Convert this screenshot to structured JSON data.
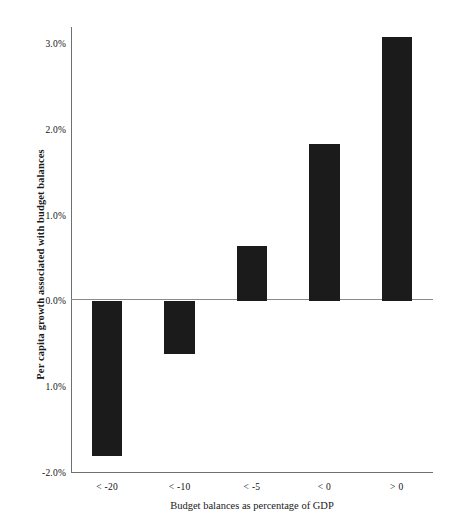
{
  "chart_data": {
    "type": "bar",
    "title": "",
    "subtitle": "",
    "xlabel": "Budget balances as percentage of GDP",
    "ylabel": "Per capita growth associated with budget balances",
    "categories": [
      "< -20",
      "< -10",
      "< -5",
      "< 0",
      "> 0"
    ],
    "values": [
      -1.8,
      -0.61,
      0.65,
      1.84,
      3.08
    ],
    "series": [
      {
        "name": "Per capita growth",
        "values": [
          -1.8,
          -0.61,
          0.65,
          1.84,
          3.08
        ]
      }
    ],
    "ylim": [
      -2.0,
      3.2
    ],
    "ytick_values": [
      3.0,
      2.0,
      1.0,
      0.0,
      -1.0,
      -2.0
    ],
    "ytick_labels": [
      "3.0%",
      "2.0%",
      "1.0%",
      "0.0%",
      "1.0%",
      "-2.0%"
    ],
    "grid": false,
    "legend": null,
    "legend_position": "none",
    "bar_color": "#1b1b1b",
    "axis_color": "#6f6f6f",
    "zero_line": 0.0,
    "annotations": []
  },
  "axes": {
    "y_ticks": [
      {
        "label": "3.0%",
        "value": 3.0
      },
      {
        "label": "2.0%",
        "value": 2.0
      },
      {
        "label": "1.0%",
        "value": 1.0
      },
      {
        "label": "0.0%",
        "value": 0.0
      },
      {
        "label": "1.0%",
        "value": -1.0
      },
      {
        "label": "-2.0%",
        "value": -2.0
      }
    ],
    "x_ticks": [
      {
        "label": "< -20",
        "value": -1.8
      },
      {
        "label": "< -10",
        "value": -0.61
      },
      {
        "label": "< -5",
        "value": 0.65
      },
      {
        "label": "< 0",
        "value": 1.84
      },
      {
        "label": "> 0",
        "value": 3.08
      }
    ]
  }
}
